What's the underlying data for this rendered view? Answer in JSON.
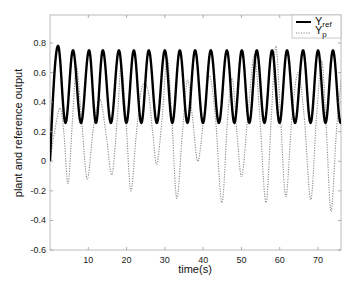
{
  "chart_data": {
    "type": "line",
    "title": "",
    "xlabel": "time(s)",
    "ylabel": "plant and reference output",
    "xlim": [
      0,
      76
    ],
    "ylim": [
      -0.6,
      1.0
    ],
    "xticks": [
      10,
      20,
      30,
      40,
      50,
      60,
      70
    ],
    "yticks": [
      -0.6,
      -0.4,
      -0.2,
      0,
      0.2,
      0.4,
      0.6,
      0.8
    ],
    "ytick_labels": [
      "-0.6",
      "-0.4",
      "-0.2",
      "0",
      "0.2",
      "0.4",
      "0.6",
      "0.8"
    ],
    "grid": false,
    "legend_position": "upper right",
    "series": [
      {
        "name": "Y_ref",
        "label_main": "Y",
        "label_sub": "ref",
        "style": "solid-thick",
        "color": "#000000",
        "description": "sinusoidal reference, rises from 0 to first peak ~0.78 at t~2s, then oscillates between ~0.26 and ~0.75 with period ~4s",
        "peak_times": [
          2.1,
          6.0,
          10.2,
          13.8,
          18.0,
          21.9,
          25.8,
          30.0,
          33.9,
          37.9,
          42.0,
          46.2,
          50.1,
          54.0,
          58.0,
          61.9,
          66.1,
          70.0,
          73.9
        ],
        "peak_values": [
          0.78,
          0.75,
          0.75,
          0.75,
          0.75,
          0.75,
          0.75,
          0.75,
          0.75,
          0.75,
          0.75,
          0.75,
          0.75,
          0.75,
          0.75,
          0.75,
          0.75,
          0.75,
          0.75
        ],
        "trough_value": 0.26,
        "period": 4.0
      },
      {
        "name": "Y_p",
        "label_main": "Y",
        "label_sub": "p",
        "style": "dotted",
        "color": "#888888",
        "description": "plant output, oscillating with varying amplitude, dips below zero",
        "points": [
          [
            0,
            0.0
          ],
          [
            1.2,
            0.2
          ],
          [
            2.6,
            0.36
          ],
          [
            3.6,
            0.2
          ],
          [
            4.7,
            -0.15
          ],
          [
            5.8,
            0.25
          ],
          [
            6.9,
            0.64
          ],
          [
            8.2,
            0.3
          ],
          [
            9.7,
            -0.12
          ],
          [
            11.2,
            0.2
          ],
          [
            12.4,
            0.38
          ],
          [
            13.4,
            0.4
          ],
          [
            14.8,
            0.15
          ],
          [
            16.2,
            -0.09
          ],
          [
            17.6,
            0.3
          ],
          [
            18.6,
            0.65
          ],
          [
            19.8,
            0.3
          ],
          [
            21.1,
            -0.2
          ],
          [
            22.6,
            0.2
          ],
          [
            24.0,
            0.5
          ],
          [
            25.6,
            0.48
          ],
          [
            26.8,
            0.2
          ],
          [
            27.9,
            -0.02
          ],
          [
            29.3,
            0.3
          ],
          [
            30.6,
            0.7
          ],
          [
            31.8,
            0.3
          ],
          [
            33.1,
            -0.25
          ],
          [
            34.6,
            0.2
          ],
          [
            35.9,
            0.55
          ],
          [
            37.2,
            0.3
          ],
          [
            38.6,
            0.0
          ],
          [
            40.2,
            0.3
          ],
          [
            41.6,
            0.58
          ],
          [
            43.2,
            0.3
          ],
          [
            44.9,
            -0.28
          ],
          [
            46.4,
            0.3
          ],
          [
            47.6,
            0.56
          ],
          [
            48.8,
            0.2
          ],
          [
            50.1,
            -0.1
          ],
          [
            51.8,
            0.35
          ],
          [
            53.4,
            0.72
          ],
          [
            54.8,
            0.3
          ],
          [
            56.4,
            -0.28
          ],
          [
            57.8,
            0.3
          ],
          [
            59.0,
            0.78
          ],
          [
            60.2,
            0.3
          ],
          [
            61.6,
            -0.24
          ],
          [
            63.2,
            0.3
          ],
          [
            64.8,
            0.6
          ],
          [
            66.4,
            0.3
          ],
          [
            68.1,
            -0.26
          ],
          [
            69.6,
            0.3
          ],
          [
            71.0,
            0.68
          ],
          [
            72.2,
            0.2
          ],
          [
            73.4,
            -0.34
          ],
          [
            74.8,
            0.2
          ],
          [
            76.0,
            0.55
          ]
        ]
      }
    ]
  },
  "legend": {
    "items": [
      {
        "main": "Y",
        "sub": "ref"
      },
      {
        "main": "Y",
        "sub": "p"
      }
    ]
  },
  "axes": {
    "xlabel": "time(s)",
    "ylabel": "plant and reference output"
  }
}
